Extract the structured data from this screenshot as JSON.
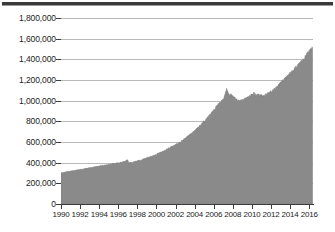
{
  "title": {
    "text": "",
    "visible_note": "title cropped off at top edge — only dark rule visible"
  },
  "chart_data": {
    "type": "area",
    "title": "",
    "subtitle": "",
    "xlabel": "",
    "ylabel": "",
    "xlim": [
      1990,
      2016.4
    ],
    "ylim": [
      0,
      1800000
    ],
    "grid": true,
    "legend": false,
    "legend_position": "none",
    "fill_color": "#8a8a8a",
    "line_color": "#7a7a7a",
    "gridline_color": "#b9b9b9",
    "axis_color": "#3c3c3c",
    "y_ticks": [
      0,
      200000,
      400000,
      600000,
      800000,
      1000000,
      1200000,
      1400000,
      1600000,
      1800000
    ],
    "y_tick_labels": [
      "0",
      "200,000",
      "400,000",
      "600,000",
      "800,000",
      "1,000,000",
      "1,200,000",
      "1,400,000",
      "1,600,000",
      "1,800,000"
    ],
    "x_ticks": [
      1990,
      1992,
      1994,
      1996,
      1998,
      2000,
      2002,
      2004,
      2006,
      2008,
      2010,
      2012,
      2014,
      2016
    ],
    "x_tick_labels": [
      "1990",
      "1992",
      "1994",
      "1996",
      "1998",
      "2000",
      "2002",
      "2004",
      "2006",
      "2008",
      "2010",
      "2012",
      "2014",
      "2016"
    ],
    "series": [
      {
        "name": "value",
        "x": [
          1990.0,
          1990.25,
          1990.5,
          1990.75,
          1991.0,
          1991.25,
          1991.5,
          1991.75,
          1992.0,
          1992.25,
          1992.5,
          1992.75,
          1993.0,
          1993.25,
          1993.5,
          1993.75,
          1994.0,
          1994.25,
          1994.5,
          1994.75,
          1995.0,
          1995.25,
          1995.5,
          1995.75,
          1996.0,
          1996.25,
          1996.5,
          1996.75,
          1996.9,
          1997.0,
          1997.1,
          1997.25,
          1997.5,
          1997.75,
          1998.0,
          1998.25,
          1998.5,
          1998.75,
          1999.0,
          1999.25,
          1999.5,
          1999.75,
          2000.0,
          2000.25,
          2000.5,
          2000.75,
          2001.0,
          2001.25,
          2001.5,
          2001.75,
          2002.0,
          2002.25,
          2002.5,
          2002.75,
          2003.0,
          2003.25,
          2003.5,
          2003.75,
          2004.0,
          2004.25,
          2004.5,
          2004.75,
          2005.0,
          2005.25,
          2005.5,
          2005.75,
          2006.0,
          2006.25,
          2006.5,
          2006.75,
          2007.0,
          2007.2,
          2007.35,
          2007.5,
          2007.65,
          2007.8,
          2008.0,
          2008.25,
          2008.5,
          2008.75,
          2009.0,
          2009.25,
          2009.5,
          2009.75,
          2010.0,
          2010.25,
          2010.4,
          2010.6,
          2010.8,
          2011.0,
          2011.25,
          2011.5,
          2011.75,
          2012.0,
          2012.25,
          2012.5,
          2012.75,
          2013.0,
          2013.25,
          2013.5,
          2013.75,
          2014.0,
          2014.25,
          2014.5,
          2014.75,
          2015.0,
          2015.25,
          2015.5,
          2015.75,
          2016.0,
          2016.2,
          2016.35
        ],
        "values": [
          300000,
          305000,
          310000,
          314000,
          318000,
          322000,
          326000,
          330000,
          334000,
          338000,
          342000,
          346000,
          350000,
          354000,
          358000,
          362000,
          366000,
          370000,
          374000,
          378000,
          382000,
          386000,
          390000,
          394000,
          398000,
          403000,
          408000,
          414000,
          425000,
          428000,
          398000,
          400000,
          404000,
          410000,
          416000,
          422000,
          428000,
          436000,
          444000,
          452000,
          460000,
          470000,
          480000,
          490000,
          500000,
          512000,
          524000,
          536000,
          548000,
          560000,
          572000,
          586000,
          600000,
          616000,
          632000,
          650000,
          668000,
          688000,
          708000,
          730000,
          752000,
          776000,
          800000,
          826000,
          852000,
          880000,
          908000,
          940000,
          968000,
          990000,
          1010000,
          1060000,
          1120000,
          1075000,
          1050000,
          1060000,
          1040000,
          1020000,
          1005000,
          1000000,
          1005000,
          1015000,
          1030000,
          1045000,
          1060000,
          1072000,
          1050000,
          1060000,
          1045000,
          1055000,
          1040000,
          1060000,
          1075000,
          1085000,
          1100000,
          1120000,
          1145000,
          1170000,
          1195000,
          1215000,
          1240000,
          1265000,
          1290000,
          1315000,
          1340000,
          1360000,
          1385000,
          1415000,
          1450000,
          1480000,
          1505000,
          1520000
        ]
      }
    ],
    "annotations": [
      {
        "label": "sharp drop",
        "x": 1997.0,
        "y": 400000
      },
      {
        "label": "peak",
        "x": 2007.35,
        "y": 1120000
      },
      {
        "label": "final value",
        "x": 2016.35,
        "y": 1520000
      }
    ],
    "noise_amplitude": 9000
  }
}
